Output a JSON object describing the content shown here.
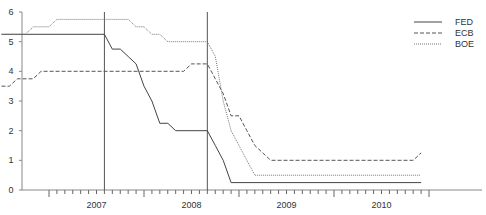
{
  "chart_data": {
    "type": "line",
    "title": "",
    "xlabel": "",
    "ylabel": "",
    "ylim": [
      0,
      6
    ],
    "yticks": [
      0,
      1,
      2,
      3,
      4,
      5,
      6
    ],
    "xtick_labels": [
      "2007",
      "2008",
      "2009",
      "2010"
    ],
    "x_range": [
      "2006-07",
      "2010-12"
    ],
    "grid": false,
    "legend_position": "upper right",
    "vertical_markers": [
      "2007-08",
      "2008-09"
    ],
    "series": [
      {
        "name": "FED",
        "style": "solid",
        "color": "#444444",
        "points": [
          [
            "2006-07",
            5.25
          ],
          [
            "2007-08",
            5.25
          ],
          [
            "2007-09",
            4.75
          ],
          [
            "2007-10",
            4.75
          ],
          [
            "2007-11",
            4.5
          ],
          [
            "2007-12",
            4.25
          ],
          [
            "2008-01",
            3.5
          ],
          [
            "2008-02",
            3.0
          ],
          [
            "2008-03",
            2.25
          ],
          [
            "2008-04",
            2.25
          ],
          [
            "2008-05",
            2.0
          ],
          [
            "2008-09",
            2.0
          ],
          [
            "2008-10",
            1.5
          ],
          [
            "2008-11",
            1.0
          ],
          [
            "2008-12",
            0.25
          ],
          [
            "2010-12",
            0.25
          ]
        ]
      },
      {
        "name": "ECB",
        "style": "dashed",
        "color": "#555555",
        "points": [
          [
            "2006-07",
            3.5
          ],
          [
            "2006-08",
            3.5
          ],
          [
            "2006-09",
            3.75
          ],
          [
            "2006-11",
            3.75
          ],
          [
            "2006-12",
            4.0
          ],
          [
            "2008-06",
            4.0
          ],
          [
            "2008-07",
            4.25
          ],
          [
            "2008-09",
            4.25
          ],
          [
            "2008-10",
            3.75
          ],
          [
            "2008-11",
            3.25
          ],
          [
            "2008-12",
            2.5
          ],
          [
            "2009-01",
            2.5
          ],
          [
            "2009-02",
            2.0
          ],
          [
            "2009-03",
            1.5
          ],
          [
            "2009-05",
            1.0
          ],
          [
            "2010-11",
            1.0
          ],
          [
            "2010-12",
            1.25
          ]
        ]
      },
      {
        "name": "BOE",
        "style": "dotted",
        "color": "#777777",
        "points": [
          [
            "2006-07",
            5.25
          ],
          [
            "2006-10",
            5.25
          ],
          [
            "2006-11",
            5.5
          ],
          [
            "2007-01",
            5.5
          ],
          [
            "2007-02",
            5.75
          ],
          [
            "2007-07",
            5.75
          ],
          [
            "2007-08",
            5.75
          ],
          [
            "2007-11",
            5.75
          ],
          [
            "2007-12",
            5.5
          ],
          [
            "2008-01",
            5.5
          ],
          [
            "2008-02",
            5.25
          ],
          [
            "2008-03",
            5.25
          ],
          [
            "2008-04",
            5.0
          ],
          [
            "2008-09",
            5.0
          ],
          [
            "2008-10",
            4.5
          ],
          [
            "2008-11",
            3.0
          ],
          [
            "2008-12",
            2.0
          ],
          [
            "2009-01",
            1.5
          ],
          [
            "2009-02",
            1.0
          ],
          [
            "2009-03",
            0.5
          ],
          [
            "2010-12",
            0.5
          ]
        ]
      }
    ]
  },
  "legend": {
    "items": [
      {
        "label": "FED",
        "style": "solid"
      },
      {
        "label": "ECB",
        "style": "dashed"
      },
      {
        "label": "BOE",
        "style": "dotted"
      }
    ]
  },
  "axis": {
    "y_labels": [
      "0",
      "1",
      "2",
      "3",
      "4",
      "5",
      "6"
    ],
    "x_labels": [
      "2007",
      "2008",
      "2009",
      "2010"
    ]
  }
}
